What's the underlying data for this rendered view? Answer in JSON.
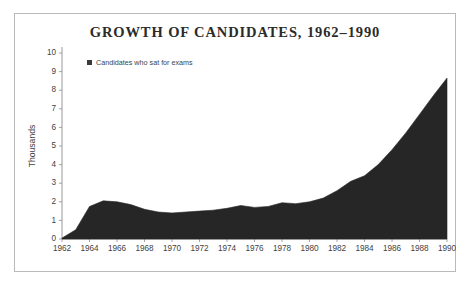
{
  "chart_data": {
    "type": "area",
    "title": "GROWTH OF CANDIDATES, 1962–1990",
    "xlabel": "",
    "ylabel": "Thousands",
    "grid": false,
    "legend_position": "top-left",
    "series": [
      {
        "name": "Candidates who sat for exams",
        "color": "#262626",
        "x": [
          1962,
          1963,
          1964,
          1965,
          1966,
          1967,
          1968,
          1969,
          1970,
          1971,
          1972,
          1973,
          1974,
          1975,
          1976,
          1977,
          1978,
          1979,
          1980,
          1981,
          1982,
          1983,
          1984,
          1985,
          1986,
          1987,
          1988,
          1989,
          1990
        ],
        "values": [
          0.05,
          0.5,
          1.75,
          2.05,
          2.0,
          1.85,
          1.6,
          1.45,
          1.4,
          1.45,
          1.5,
          1.55,
          1.65,
          1.8,
          1.7,
          1.75,
          1.95,
          1.9,
          2.0,
          2.2,
          2.6,
          3.1,
          3.4,
          4.0,
          4.8,
          5.7,
          6.7,
          7.7,
          8.65
        ]
      }
    ],
    "xticks": [
      1962,
      1964,
      1966,
      1968,
      1970,
      1972,
      1974,
      1976,
      1978,
      1980,
      1982,
      1984,
      1986,
      1988,
      1990
    ],
    "yticks": [
      0,
      1,
      2,
      3,
      4,
      5,
      6,
      7,
      8,
      9,
      10
    ],
    "xlim": [
      1962,
      1990
    ],
    "ylim": [
      0,
      10
    ]
  },
  "legend": {
    "label": "Candidates who sat for exams"
  }
}
